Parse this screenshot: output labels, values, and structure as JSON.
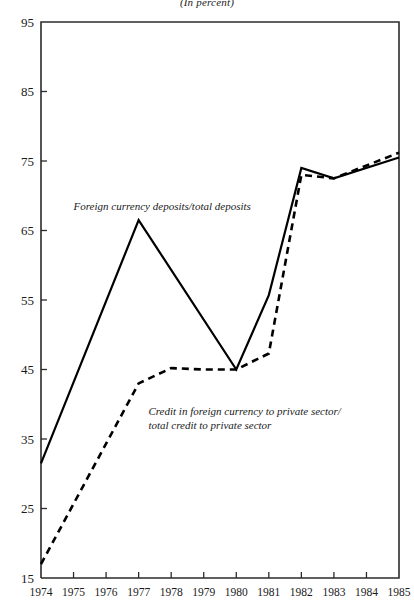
{
  "subtitle": "(In percent)",
  "chart_data": {
    "type": "line",
    "title": "",
    "subtitle": "(In percent)",
    "xlabel": "",
    "ylabel": "",
    "xlim": [
      1974,
      1985
    ],
    "ylim": [
      15,
      95
    ],
    "grid": false,
    "legend_position": "inline-annotation",
    "x": [
      1974,
      1975,
      1976,
      1977,
      1978,
      1979,
      1980,
      1981,
      1982,
      1983,
      1984,
      1985
    ],
    "ytick_labels": [
      "95",
      "85",
      "75",
      "65",
      "55",
      "45",
      "35",
      "25",
      "15"
    ],
    "ytick_values": [
      95,
      85,
      75,
      65,
      55,
      45,
      35,
      25,
      15
    ],
    "xtick_labels": [
      "1974",
      "1975",
      "1976",
      "1977",
      "1978",
      "1979",
      "1980",
      "1981",
      "1982",
      "1983",
      "1984",
      "1985"
    ],
    "series": [
      {
        "name": "Foreign currency deposits/total deposits",
        "style": "solid",
        "label_text": "Foreign currency deposits/total deposits",
        "label_x": 1975.0,
        "label_y": 68.0,
        "x": [
          1974,
          1977,
          1980,
          1981,
          1982,
          1983,
          1985
        ],
        "values": [
          31.5,
          66.5,
          45.0,
          55.7,
          74.0,
          72.5,
          75.5
        ]
      },
      {
        "name": "Credit in foreign currency to private sector/total credit to private sector",
        "style": "dashed",
        "label_line1": "Credit in foreign currency to private sector/",
        "label_line2": "total credit to private sector",
        "label_x": 1977.3,
        "label_y": 38.5,
        "x": [
          1974,
          1977,
          1978,
          1979,
          1980,
          1981,
          1982,
          1983,
          1985
        ],
        "values": [
          17.0,
          43.0,
          45.2,
          45.0,
          45.0,
          47.3,
          73.0,
          72.5,
          76.2
        ]
      }
    ]
  },
  "colors": {
    "axis": "#2b2b2b",
    "line": "#000000",
    "text": "#1a1a1a",
    "background": "#ffffff"
  }
}
